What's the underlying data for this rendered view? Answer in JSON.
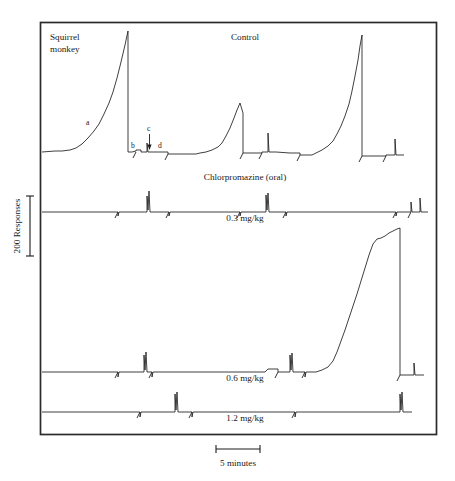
{
  "figure": {
    "subject_label": "Squirrel\nmonkey",
    "subject_label_line1": "Squirrel",
    "subject_label_line2": "monkey",
    "condition_label": "Control",
    "drug_label": "Chlorpromazine (oral)",
    "y_axis_label": "200 Responses",
    "x_scale_label": "5 minutes",
    "point_markers": [
      "a",
      "b",
      "c",
      "d"
    ],
    "frame": {
      "x": 40,
      "y": 22,
      "width": 397,
      "height": 413
    },
    "doses": [
      "0.3 mg/kg",
      "0.6 mg/kg",
      "1.2 mg/kg"
    ]
  },
  "chart_data": {
    "type": "line",
    "xlabel": "Time",
    "ylabel": "Cumulative responses",
    "x_scale_bar": {
      "label": "5 minutes",
      "minutes": 5,
      "px_length": 44
    },
    "y_scale_bar": {
      "label": "200 Responses",
      "responses": 200,
      "px_length": 60
    },
    "grid": false,
    "legend": null,
    "annotations": [
      {
        "text": "a",
        "x": 88,
        "y": 122,
        "note": "positively accelerated scallop of responding"
      },
      {
        "text": "b",
        "x": 133,
        "y": 145,
        "note": "post-reinforcement pause / start of next cycle"
      },
      {
        "text": "c",
        "x": 149,
        "y": 129,
        "note": "small burst of responses"
      },
      {
        "text": "d",
        "x": 160,
        "y": 146,
        "note": "low-rate baseline segment"
      }
    ],
    "panels": [
      {
        "name": "control",
        "label": "Control",
        "dose": null,
        "baseline_y": 152,
        "description": "Large fixed-interval scallops with high terminal rates; three major cumulative runs separated by resets.",
        "major_bursts": 3,
        "peak_heights_responses": [
          420,
          130,
          360
        ],
        "series": [
          {
            "name": "cumulative-responses",
            "points": [
              [
                42,
                152
              ],
              [
                55,
                151
              ],
              [
                62,
                151
              ],
              [
                70,
                150
              ],
              [
                76,
                148
              ],
              [
                82,
                144
              ],
              [
                88,
                138
              ],
              [
                94,
                131
              ],
              [
                99,
                124
              ],
              [
                104,
                114
              ],
              [
                109,
                103
              ],
              [
                113,
                92
              ],
              [
                117,
                78
              ],
              [
                121,
                62
              ],
              [
                125,
                45
              ],
              [
                128,
                31
              ],
              [
                128,
                152
              ],
              [
                132,
                152
              ],
              [
                136,
                151
              ],
              [
                136,
                150
              ],
              [
                141,
                150
              ],
              [
                141,
                152
              ],
              [
                147,
                152
              ],
              [
                147,
                143
              ],
              [
                148,
                152
              ],
              [
                155,
                152
              ],
              [
                168,
                152
              ],
              [
                168,
                154
              ],
              [
                196,
                154
              ],
              [
                200,
                153
              ],
              [
                206,
                152
              ],
              [
                212,
                150
              ],
              [
                218,
                147
              ],
              [
                222,
                143
              ],
              [
                226,
                136
              ],
              [
                230,
                128
              ],
              [
                234,
                118
              ],
              [
                237,
                110
              ],
              [
                240,
                103
              ],
              [
                243,
                113
              ],
              [
                243,
                153
              ],
              [
                250,
                153
              ],
              [
                262,
                153
              ],
              [
                262,
                152
              ],
              [
                268,
                152
              ],
              [
                268,
                133
              ],
              [
                269,
                152
              ],
              [
                276,
                152
              ],
              [
                290,
                153
              ],
              [
                300,
                153
              ],
              [
                300,
                155
              ],
              [
                312,
                155
              ],
              [
                316,
                153
              ],
              [
                322,
                150
              ],
              [
                328,
                146
              ],
              [
                333,
                141
              ],
              [
                337,
                134
              ],
              [
                341,
                126
              ],
              [
                345,
                116
              ],
              [
                349,
                104
              ],
              [
                352,
                91
              ],
              [
                355,
                76
              ],
              [
                358,
                60
              ],
              [
                360,
                46
              ],
              [
                362,
                35
              ],
              [
                362,
                156
              ],
              [
                372,
                156
              ],
              [
                386,
                156
              ],
              [
                386,
                155
              ],
              [
                395,
                155
              ],
              [
                395,
                139
              ],
              [
                396,
                155
              ],
              [
                404,
                155
              ]
            ]
          }
        ]
      },
      {
        "name": "dose-0-3",
        "label": "0.3 mg/kg",
        "dose": "0.3 mg/kg",
        "baseline_y": 212,
        "description": "Responding largely suppressed; only brief small bursts remain, no sustained scallops.",
        "major_bursts": 2,
        "peak_heights_responses": [
          55,
          50
        ],
        "series": [
          {
            "name": "cumulative-responses",
            "points": [
              [
                42,
                212
              ],
              [
                80,
                212
              ],
              [
                118,
                212
              ],
              [
                118,
                216
              ],
              [
                119,
                212
              ],
              [
                147,
                212
              ],
              [
                147,
                196
              ],
              [
                148,
                210
              ],
              [
                149,
                191
              ],
              [
                150,
                212
              ],
              [
                151,
                212
              ],
              [
                169,
                212
              ],
              [
                169,
                216
              ],
              [
                170,
                212
              ],
              [
                210,
                212
              ],
              [
                240,
                212
              ],
              [
                240,
                216
              ],
              [
                241,
                212
              ],
              [
                266,
                212
              ],
              [
                266,
                195
              ],
              [
                267,
                210
              ],
              [
                268,
                193
              ],
              [
                269,
                212
              ],
              [
                286,
                212
              ],
              [
                286,
                216
              ],
              [
                287,
                212
              ],
              [
                320,
                212
              ],
              [
                360,
                212
              ],
              [
                396,
                212
              ],
              [
                396,
                216
              ],
              [
                397,
                212
              ],
              [
                411,
                212
              ],
              [
                411,
                202
              ],
              [
                412,
                212
              ],
              [
                420,
                212
              ],
              [
                420,
                198
              ],
              [
                421,
                212
              ],
              [
                428,
                212
              ]
            ]
          }
        ]
      },
      {
        "name": "dose-0-6",
        "label": "0.6 mg/kg",
        "dose": "0.6 mg/kg",
        "baseline_y": 372,
        "description": "Long period of near-zero responding followed by one very large terminal run late in the session.",
        "major_bursts": 1,
        "peak_heights_responses": [
          480
        ],
        "series": [
          {
            "name": "cumulative-responses",
            "points": [
              [
                42,
                372
              ],
              [
                80,
                372
              ],
              [
                118,
                372
              ],
              [
                118,
                377
              ],
              [
                119,
                372
              ],
              [
                144,
                372
              ],
              [
                144,
                355
              ],
              [
                145,
                370
              ],
              [
                146,
                352
              ],
              [
                147,
                372
              ],
              [
                152,
                372
              ],
              [
                152,
                377
              ],
              [
                153,
                372
              ],
              [
                180,
                372
              ],
              [
                220,
                372
              ],
              [
                265,
                372
              ],
              [
                268,
                369
              ],
              [
                278,
                369
              ],
              [
                278,
                372
              ],
              [
                290,
                372
              ],
              [
                290,
                355
              ],
              [
                291,
                370
              ],
              [
                292,
                353
              ],
              [
                293,
                372
              ],
              [
                305,
                372
              ],
              [
                305,
                377
              ],
              [
                306,
                372
              ],
              [
                316,
                372
              ],
              [
                322,
                370
              ],
              [
                328,
                367
              ],
              [
                333,
                361
              ],
              [
                337,
                352
              ],
              [
                341,
                341
              ],
              [
                345,
                330
              ],
              [
                349,
                318
              ],
              [
                353,
                306
              ],
              [
                357,
                294
              ],
              [
                361,
                281
              ],
              [
                365,
                268
              ],
              [
                369,
                255
              ],
              [
                373,
                244
              ],
              [
                377,
                239
              ],
              [
                381,
                238
              ],
              [
                385,
                236
              ],
              [
                389,
                233
              ],
              [
                393,
                231
              ],
              [
                397,
                229
              ],
              [
                400,
                228
              ],
              [
                400,
                375
              ],
              [
                414,
                375
              ],
              [
                414,
                363
              ],
              [
                415,
                375
              ],
              [
                424,
                375
              ]
            ]
          }
        ]
      },
      {
        "name": "dose-1-2",
        "label": "1.2 mg/kg",
        "dose": "1.2 mg/kg",
        "baseline_y": 412,
        "description": "Responding almost entirely eliminated; only two isolated small bursts across the session.",
        "major_bursts": 2,
        "peak_heights_responses": [
          60,
          55
        ],
        "series": [
          {
            "name": "cumulative-responses",
            "points": [
              [
                42,
                412
              ],
              [
                90,
                412
              ],
              [
                140,
                412
              ],
              [
                140,
                417
              ],
              [
                141,
                412
              ],
              [
                175,
                412
              ],
              [
                175,
                394
              ],
              [
                176,
                410
              ],
              [
                177,
                392
              ],
              [
                178,
                412
              ],
              [
                192,
                412
              ],
              [
                192,
                417
              ],
              [
                193,
                412
              ],
              [
                250,
                412
              ],
              [
                295,
                412
              ],
              [
                295,
                417
              ],
              [
                296,
                412
              ],
              [
                350,
                412
              ],
              [
                400,
                412
              ],
              [
                400,
                394
              ],
              [
                401,
                410
              ],
              [
                402,
                392
              ],
              [
                403,
                412
              ],
              [
                412,
                412
              ]
            ]
          }
        ]
      }
    ]
  }
}
